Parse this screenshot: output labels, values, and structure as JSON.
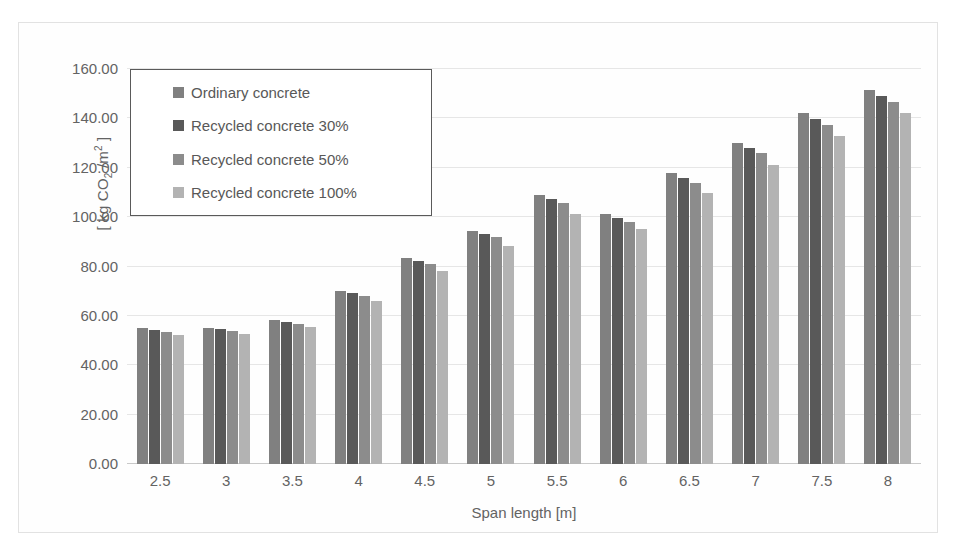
{
  "chart_data": {
    "type": "bar",
    "title": "",
    "xlabel": "Span length [m]",
    "ylabel": "[ kg CO2 /m2 ]",
    "ylim": [
      0,
      160
    ],
    "ytick_step": 20,
    "grid": true,
    "legend_position": "upper-left-inside",
    "categories": [
      "2.5",
      "3",
      "3.5",
      "4",
      "4.5",
      "5",
      "5.5",
      "6",
      "6.5",
      "7",
      "7.5",
      "8"
    ],
    "ytick_labels": [
      "0.00",
      "20.00",
      "40.00",
      "60.00",
      "80.00",
      "100.00",
      "120.00",
      "140.00",
      "160.00"
    ],
    "series": [
      {
        "name": "Ordinary concrete",
        "color": "#808080",
        "values": [
          55.0,
          55.2,
          58.4,
          70.1,
          83.3,
          94.4,
          109.0,
          101.2,
          117.8,
          130.2,
          142.3,
          151.6
        ]
      },
      {
        "name": "Recycled concrete 30%",
        "color": "#595959",
        "values": [
          54.3,
          54.5,
          57.6,
          69.1,
          82.1,
          93.1,
          107.4,
          99.7,
          115.9,
          128.1,
          139.8,
          149.2
        ]
      },
      {
        "name": "Recycled concrete 50%",
        "color": "#8c8c8c",
        "values": [
          53.5,
          53.7,
          56.7,
          68.1,
          80.9,
          91.8,
          105.8,
          98.2,
          113.9,
          125.9,
          137.4,
          146.7
        ]
      },
      {
        "name": "Recycled concrete 100%",
        "color": "#b3b3b3",
        "values": [
          52.3,
          52.5,
          55.3,
          66.0,
          78.1,
          88.2,
          101.3,
          95.0,
          109.9,
          121.3,
          133.0,
          142.3
        ]
      }
    ]
  },
  "axis": {
    "y_title_prefix": "[ kg CO",
    "y_title_sub": "2",
    "y_title_mid": " /m",
    "y_title_sup": "2",
    "y_title_suffix": " ]"
  }
}
